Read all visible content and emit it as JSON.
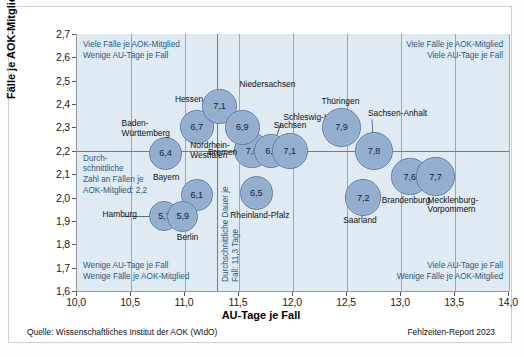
{
  "chart_data": {
    "type": "scatter",
    "title": "",
    "xlabel": "AU-Tage je Fall",
    "ylabel": "Fälle je AOK-Mitglied",
    "xlim": [
      10.0,
      14.0
    ],
    "ylim": [
      1.6,
      2.7
    ],
    "xticks": [
      "10,0",
      "10,5",
      "11,0",
      "11,5",
      "12,0",
      "12,5",
      "13,0",
      "13,5",
      "14,0"
    ],
    "yticks": [
      "2,7",
      "2,6",
      "2,5",
      "2,4",
      "2,3",
      "2,2",
      "2,1",
      "2,0",
      "1,9",
      "1,8",
      "1,7",
      "1,6"
    ],
    "grid": true,
    "legend": "none",
    "reference_lines": {
      "vertical_x": 11.3,
      "vertical_label": "Durchschnittliche Dauer je\nFall: 11,3 Tage",
      "horizontal_y": 2.2,
      "horizontal_label": "Durch-\nschnittliche\nZahl an Fällen je\nAOK-Mitglied: 2,2"
    },
    "points": [
      {
        "name": "Baden-Württemberg",
        "x": 10.82,
        "y": 2.19,
        "label": "6,4",
        "value": 6.4
      },
      {
        "name": "Hessen",
        "x": 11.11,
        "y": 2.3,
        "label": "6,7",
        "value": 6.7
      },
      {
        "name": "Niedersachsen",
        "x": 11.32,
        "y": 2.39,
        "label": "7,1",
        "value": 7.1
      },
      {
        "name": "Bremen",
        "x": 11.62,
        "y": 2.2,
        "label": "7,0",
        "value": 7.0
      },
      {
        "name": "Nordrhein-Westfalen",
        "x": 11.53,
        "y": 2.3,
        "label": "6,9",
        "value": 6.9
      },
      {
        "name": "Schleswig-Holstein",
        "x": 11.8,
        "y": 2.2,
        "label": "6,7",
        "value": 6.7
      },
      {
        "name": "Bayern",
        "x": 11.11,
        "y": 2.01,
        "label": "6,1",
        "value": 6.1
      },
      {
        "name": "Hamburg",
        "x": 10.81,
        "y": 1.92,
        "label": "5,7",
        "value": 5.7
      },
      {
        "name": "Berlin",
        "x": 10.98,
        "y": 1.92,
        "label": "5,9",
        "value": 5.9
      },
      {
        "name": "Rheinland-Pfalz",
        "x": 11.66,
        "y": 2.02,
        "label": "6,5",
        "value": 6.5
      },
      {
        "name": "Sachsen",
        "x": 11.97,
        "y": 2.2,
        "label": "7,1",
        "value": 7.1
      },
      {
        "name": "Thüringen",
        "x": 12.45,
        "y": 2.3,
        "label": "7,9",
        "value": 7.9
      },
      {
        "name": "Sachsen-Anhalt",
        "x": 12.75,
        "y": 2.2,
        "label": "7,8",
        "value": 7.8
      },
      {
        "name": "Saarland",
        "x": 12.65,
        "y": 2.0,
        "label": "7,2",
        "value": 7.2
      },
      {
        "name": "Brandenburg",
        "x": 13.08,
        "y": 2.09,
        "label": "7,6",
        "value": 7.6
      },
      {
        "name": "Mecklenburg-Vorpommern",
        "x": 13.32,
        "y": 2.09,
        "label": "7,7",
        "value": 7.7
      }
    ],
    "quadrant_notes": {
      "top_left": "Viele Fälle je AOK-Mitglied\nWenige AU-Tage je Fall",
      "top_right": "Viele Fälle je AOK-Mitglied\nViele AU-Tage je Fall",
      "bottom_left": "Wenige AU-Tage je Fall\nWenige Fälle je AOK-Mitglied",
      "bottom_right": "Viele AU-Tage je Fall\nWenige Fälle je AOK-Mitglied"
    }
  },
  "footer": {
    "source": "Quelle: Wissenschaftliches Institut der AOK (WIdO)",
    "report": "Fehlzeiten-Report 2023"
  },
  "colors": {
    "bubble_fill": "#93aece",
    "bubble_stroke": "#5c7ba6",
    "plot_bg": "#dfeaf2",
    "note_text": "#2b5a84",
    "grid": "#9aa7b4"
  }
}
